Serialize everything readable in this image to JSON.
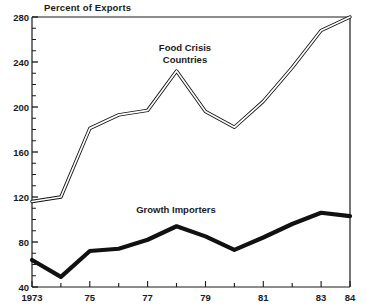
{
  "chart_data": {
    "type": "line",
    "title": "Percent of Exports",
    "xlabel": "",
    "ylabel": "",
    "ylim": [
      40,
      280
    ],
    "xlim": [
      1973,
      1984
    ],
    "grid": false,
    "legend_position": "inline-annotations",
    "x": [
      1973,
      1974,
      1975,
      1976,
      1977,
      1978,
      1979,
      1980,
      1981,
      1982,
      1983,
      1984
    ],
    "x_tick_labels": [
      "1973",
      "",
      "75",
      "",
      "77",
      "",
      "79",
      "",
      "81",
      "",
      "83",
      "84"
    ],
    "y_ticks": [
      40,
      80,
      120,
      160,
      200,
      240,
      280
    ],
    "y_tick_labels": [
      "40",
      "80",
      "120",
      "160",
      "200",
      "240",
      "280"
    ],
    "y_minor_tick_step": 10,
    "series": [
      {
        "name": "Food Crisis Countries",
        "style": "double-hollow-line",
        "values": [
          116,
          120,
          181,
          193,
          197,
          232,
          196,
          182,
          205,
          235,
          268,
          280
        ]
      },
      {
        "name": "Growth Importers",
        "style": "thick-solid-line",
        "values": [
          64,
          49,
          72,
          74,
          82,
          94,
          85,
          73,
          84,
          96,
          106,
          103
        ]
      }
    ],
    "annotations": [
      {
        "text": "Food Crisis",
        "x_px": 185,
        "y_px": 50
      },
      {
        "text": "Countries",
        "x_px": 185,
        "y_px": 62
      },
      {
        "text": "Growth Importers",
        "x_px": 175,
        "y_px": 212
      }
    ],
    "colors": {
      "line": "#111111",
      "axis": "#1a1a1a",
      "background": "#ffffff"
    }
  },
  "labels": {
    "title": "Percent of Exports",
    "food_crisis_line1": "Food Crisis",
    "food_crisis_line2": "Countries",
    "growth_importers": "Growth Importers",
    "y_40": "40",
    "y_80": "80",
    "y_120": "120",
    "y_160": "160",
    "y_200": "200",
    "y_240": "240",
    "y_280": "280",
    "x_1973": "1973",
    "x_75": "75",
    "x_77": "77",
    "x_79": "79",
    "x_81": "81",
    "x_83": "83",
    "x_84": "84"
  }
}
